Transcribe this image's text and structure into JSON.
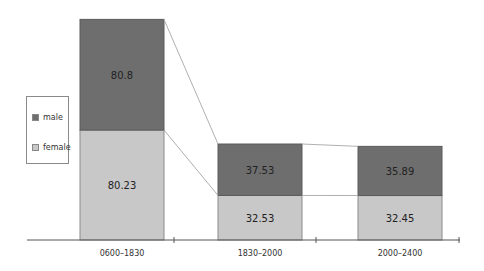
{
  "chart_data": {
    "type": "bar",
    "stacked": true,
    "title": "",
    "xlabel": "",
    "ylabel": "",
    "categories": [
      "0600–1830",
      "1830–2000",
      "2000–2400"
    ],
    "series": [
      {
        "name": "female",
        "values": [
          80.23,
          32.53,
          32.45
        ],
        "color": "#c8c8c8"
      },
      {
        "name": "male",
        "values": [
          80.8,
          37.53,
          35.89
        ],
        "color": "#6e6e6e"
      }
    ],
    "connector_lines": true,
    "grid": false,
    "legend_position": "left",
    "data_labels": true
  },
  "legend": {
    "items": [
      {
        "label": "male",
        "color": "#6e6e6e"
      },
      {
        "label": "female",
        "color": "#c8c8c8"
      }
    ]
  }
}
